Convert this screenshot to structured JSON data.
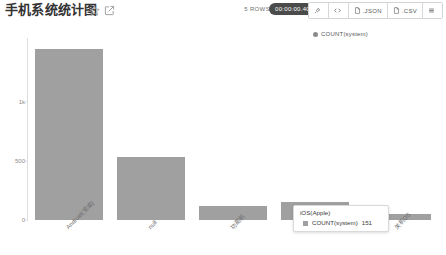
{
  "header": {
    "title": "手机系统统计图",
    "favorite_icon": "star-icon",
    "edit_icon": "edit-square-icon",
    "rows_label": "5 ROWS",
    "timer": "00:00:00.40",
    "buttons": [
      {
        "name": "pin-button",
        "icon": "pin-icon",
        "label": ""
      },
      {
        "name": "code-button",
        "icon": "code-icon",
        "label": ""
      },
      {
        "name": "json-button",
        "icon": "file-icon",
        "label": ".JSON"
      },
      {
        "name": "csv-button",
        "icon": "file-icon",
        "label": ".CSV"
      },
      {
        "name": "menu-button",
        "icon": "hamburger-icon",
        "label": ""
      }
    ]
  },
  "legend": {
    "position": "top-right",
    "entries": [
      {
        "label": "COUNT(system)",
        "color": "#8b8b8b"
      }
    ]
  },
  "tooltip": {
    "title": "iOS(Apple)",
    "metric": "COUNT(system)",
    "value": "151",
    "swatch": "#a0a0a0"
  },
  "chart_data": {
    "type": "bar",
    "title": "手机系统统计图",
    "xlabel": "",
    "ylabel": "",
    "categories": [
      "Android(安卓)",
      "null",
      "功能机",
      "iOS(Apple)",
      "关机OS"
    ],
    "values": [
      1450,
      530,
      115,
      151,
      50
    ],
    "series": [
      {
        "name": "COUNT(system)",
        "values": [
          1450,
          530,
          115,
          151,
          50
        ],
        "color": "#a0a0a0"
      }
    ],
    "ylim": [
      0,
      1540
    ],
    "yticks": [
      0,
      500,
      1000
    ],
    "ytick_labels": [
      "0",
      "500",
      "1k"
    ],
    "grid": false,
    "legend_position": "top-right",
    "bar_color": "#a0a0a0"
  }
}
